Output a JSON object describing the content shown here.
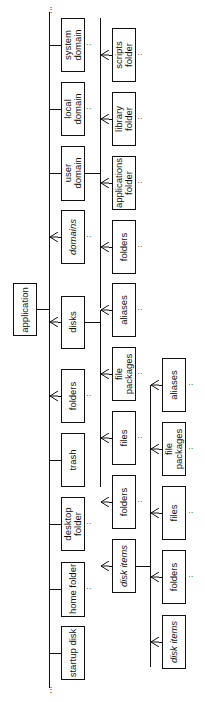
{
  "diagram": {
    "root": {
      "label": "application"
    },
    "level1": [
      {
        "label": "system\ndomain",
        "italic": false,
        "many": false
      },
      {
        "label": "local\ndomain",
        "italic": false,
        "many": false
      },
      {
        "label": "user\ndomain",
        "italic": false,
        "many": false
      },
      {
        "label": "domains",
        "italic": true,
        "many": true
      },
      {
        "label": "disks",
        "italic": false,
        "many": true
      },
      {
        "label": "folders",
        "italic": false,
        "many": true
      },
      {
        "label": "trash",
        "italic": false,
        "many": false
      },
      {
        "label": "desktop\nfolder",
        "italic": false,
        "many": false
      },
      {
        "label": "home folder",
        "italic": false,
        "many": false
      },
      {
        "label": "startup disk",
        "italic": false,
        "many": false
      }
    ],
    "level2_domain": [
      {
        "label": "scripts\nfolder",
        "many": true
      },
      {
        "label": "library\nfolder",
        "many": true
      },
      {
        "label": "applications\nfolder",
        "many": true
      },
      {
        "label": "folders",
        "many": true
      }
    ],
    "level2_disk": [
      {
        "label": "aliases",
        "many": true
      },
      {
        "label": "file\npackages",
        "many": true
      },
      {
        "label": "files",
        "many": true
      },
      {
        "label": "folders",
        "many": true
      },
      {
        "label": "disk items",
        "italic": true,
        "many": true
      }
    ],
    "level3_diskitems": [
      {
        "label": "aliases",
        "many": true
      },
      {
        "label": "file\npackages",
        "many": true
      },
      {
        "label": "files",
        "many": true
      },
      {
        "label": "folders",
        "many": true
      },
      {
        "label": "disk items",
        "italic": true,
        "many": true
      }
    ]
  }
}
